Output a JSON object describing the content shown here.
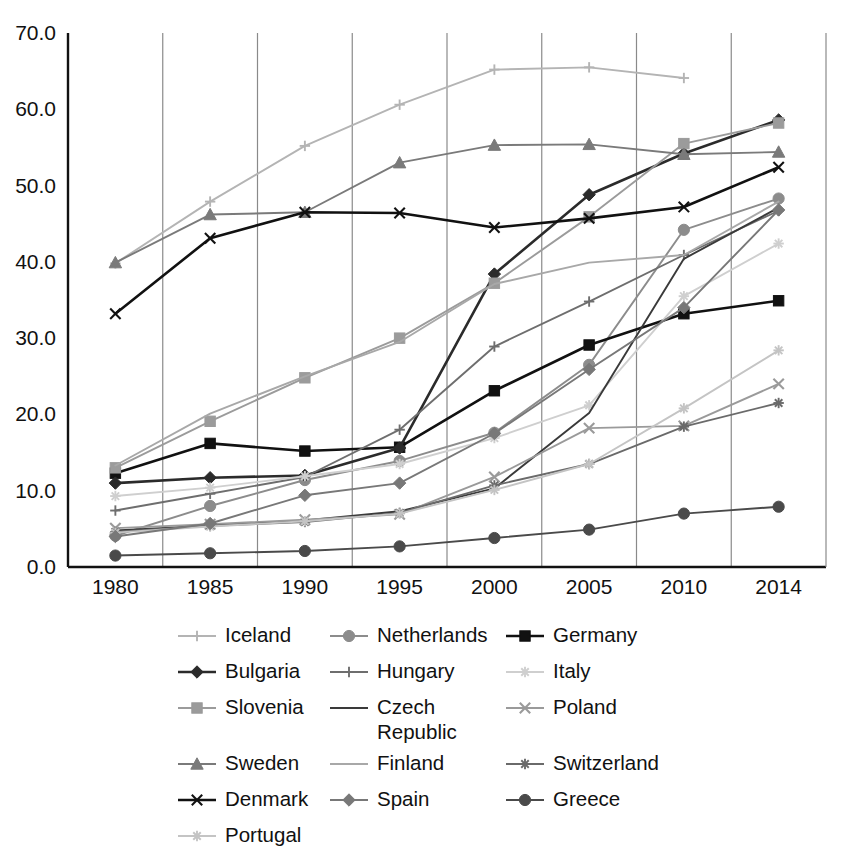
{
  "chart_data": {
    "type": "line",
    "title": "",
    "xlabel": "",
    "ylabel": "",
    "categories": [
      "1980",
      "1985",
      "1990",
      "1995",
      "2000",
      "2005",
      "2010",
      "2014"
    ],
    "x_tick_labels": [
      "1980",
      "1985",
      "1990",
      "1995",
      "2000",
      "2005",
      "2010",
      "2014"
    ],
    "y_tick_labels": [
      "0.0",
      "10.0",
      "20.0",
      "30.0",
      "40.0",
      "50.0",
      "60.0",
      "70.0"
    ],
    "y_ticks": [
      0,
      10,
      20,
      30,
      40,
      50,
      60,
      70
    ],
    "ylim": [
      0,
      70
    ],
    "grid": "vertical",
    "legend_position": "bottom",
    "series": [
      {
        "name": "Iceland",
        "marker": "plus",
        "color": "#b4b4b4",
        "values": [
          39.8,
          47.9,
          55.2,
          60.6,
          65.2,
          65.5,
          64.1,
          null
        ]
      },
      {
        "name": "Netherlands",
        "marker": "circle",
        "color": "#8c8c8c",
        "values": [
          4.1,
          8.0,
          11.4,
          13.9,
          17.6,
          26.5,
          44.2,
          48.3
        ]
      },
      {
        "name": "Germany",
        "marker": "square",
        "color": "#111111",
        "values": [
          12.3,
          16.2,
          15.2,
          15.7,
          23.1,
          29.1,
          33.2,
          34.9
        ]
      },
      {
        "name": "Bulgaria",
        "marker": "diamond",
        "color": "#2b2b2b",
        "values": [
          11.0,
          11.7,
          12.0,
          15.6,
          38.4,
          48.8,
          54.2,
          58.6
        ]
      },
      {
        "name": "Hungary",
        "marker": "plus",
        "color": "#6e6e6e",
        "values": [
          7.4,
          9.6,
          11.8,
          18.0,
          28.9,
          34.8,
          40.9,
          46.7
        ]
      },
      {
        "name": "Italy",
        "marker": "star",
        "color": "#cfcfcf",
        "values": [
          9.3,
          10.4,
          11.9,
          13.5,
          16.9,
          21.2,
          35.5,
          42.4
        ]
      },
      {
        "name": "Slovenia",
        "marker": "square",
        "color": "#9b9b9b",
        "values": [
          13.0,
          19.1,
          24.8,
          30.0,
          37.2,
          45.9,
          55.5,
          58.2
        ]
      },
      {
        "name": "Czech Republic",
        "marker": "line",
        "color": "#3a3a3a",
        "values": [
          4.8,
          5.4,
          6.1,
          7.3,
          10.3,
          20.2,
          40.4,
          47.1
        ]
      },
      {
        "name": "Poland",
        "marker": "x",
        "color": "#9a9a9a",
        "values": [
          5.1,
          5.6,
          6.2,
          6.9,
          11.8,
          18.2,
          18.5,
          24.0
        ]
      },
      {
        "name": "Sweden",
        "marker": "triangle",
        "color": "#7a7a7a",
        "values": [
          39.9,
          46.2,
          46.5,
          53.0,
          55.3,
          55.4,
          54.1,
          54.4
        ]
      },
      {
        "name": "Switzerland",
        "marker": "asterisk",
        "color": "#6a6a6a",
        "values": [
          4.6,
          5.4,
          5.9,
          7.1,
          10.7,
          13.5,
          18.4,
          21.5
        ]
      },
      {
        "name": "Denmark",
        "marker": "x",
        "color": "#111111",
        "values": [
          33.2,
          43.1,
          46.5,
          46.4,
          44.5,
          45.7,
          47.2,
          52.4
        ]
      },
      {
        "name": "Finland",
        "marker": "line",
        "color": "#a8a8a8",
        "values": [
          13.3,
          20.1,
          25.0,
          29.5,
          37.1,
          39.9,
          40.9,
          47.9
        ]
      },
      {
        "name": "Greece",
        "marker": "circle",
        "color": "#4a4a4a",
        "values": [
          1.5,
          1.8,
          2.1,
          2.7,
          3.8,
          4.9,
          7.0,
          7.9
        ]
      },
      {
        "name": "Portugal",
        "marker": "star",
        "color": "#c4c4c4",
        "values": [
          4.5,
          5.3,
          6.0,
          7.0,
          10.1,
          13.5,
          20.8,
          28.4
        ]
      },
      {
        "name": "Spain",
        "marker": "diamond",
        "color": "#787878",
        "values": [
          4.0,
          5.7,
          9.4,
          11.0,
          17.5,
          25.9,
          34.0,
          46.8
        ]
      }
    ]
  },
  "legend": {
    "columns": [
      [
        {
          "label": "Iceland",
          "series": "Iceland"
        },
        {
          "label": "Bulgaria",
          "series": "Bulgaria"
        },
        {
          "label": "Slovenia",
          "series": "Slovenia"
        },
        {
          "label": "Sweden",
          "series": "Sweden"
        },
        {
          "label": "Denmark",
          "series": "Denmark"
        },
        {
          "label": "Portugal",
          "series": "Portugal"
        }
      ],
      [
        {
          "label": "Netherlands",
          "series": "Netherlands"
        },
        {
          "label": "Hungary",
          "series": "Hungary"
        },
        {
          "label": "Czech\nRepublic",
          "series": "Czech Republic"
        },
        {
          "label": "Finland",
          "series": "Finland"
        },
        {
          "label": "Spain",
          "series": "Spain"
        }
      ],
      [
        {
          "label": "Germany",
          "series": "Germany"
        },
        {
          "label": "Italy",
          "series": "Italy"
        },
        {
          "label": "Poland",
          "series": "Poland"
        },
        {
          "label": "Switzerland",
          "series": "Switzerland"
        },
        {
          "label": "Greece",
          "series": "Greece"
        }
      ]
    ]
  }
}
